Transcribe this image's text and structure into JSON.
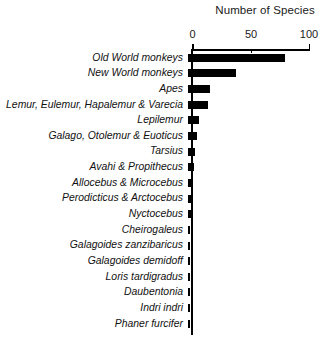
{
  "chart_data": {
    "type": "bar",
    "orientation": "horizontal",
    "title": "Number of Species",
    "xlabel": "",
    "ylabel": "",
    "xlim": [
      0,
      100
    ],
    "xticks": [
      0,
      50,
      100
    ],
    "xtick_labels": [
      "0",
      "50",
      "100"
    ],
    "grid": false,
    "legend": null,
    "bar_color": "#000000",
    "categories": [
      "Old World monkeys",
      "New World monkeys",
      "Apes",
      "Lemur, Eulemur, Hapalemur & Varecia",
      "Lepilemur",
      "Galago, Otolemur & Euoticus",
      "Tarsius",
      "Avahi & Propithecus",
      "Allocebus & Microcebus",
      "Perodicticus & Arctocebus",
      "Nyctocebus",
      "Cheirogaleus",
      "Galagoides zanzibaricus",
      "Galagoides demidoff",
      "Loris tardigradus",
      "Daubentonia",
      "Indri indri",
      "Phaner furcifer"
    ],
    "values": [
      82,
      41,
      19,
      17,
      9,
      8,
      6,
      5,
      4,
      4,
      3,
      2,
      1,
      1,
      1,
      1,
      1,
      1
    ]
  },
  "axis": {
    "ticks": [
      {
        "label": "0",
        "value": 0
      },
      {
        "label": "50",
        "value": 50
      },
      {
        "label": "100",
        "value": 100
      }
    ]
  }
}
